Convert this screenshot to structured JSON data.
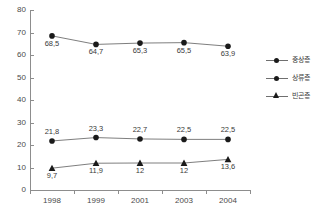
{
  "chart_data": {
    "type": "line",
    "title": "",
    "xlabel": "",
    "ylabel": "",
    "categories": [
      "1998",
      "1999",
      "2001",
      "2003",
      "2004"
    ],
    "ylim": [
      0,
      80
    ],
    "ytick_step": 10,
    "yticks": [
      "80",
      "70",
      "60",
      "50",
      "40",
      "30",
      "20",
      "10",
      "0"
    ],
    "grid": false,
    "legend_position": "right",
    "decimal_separator": ",",
    "series": [
      {
        "name": "중상층",
        "marker": "circle",
        "label_position": "below",
        "values": [
          68.5,
          64.7,
          65.3,
          65.5,
          63.9
        ],
        "labels": [
          "68,5",
          "64,7",
          "65,3",
          "65,5",
          "63,9"
        ]
      },
      {
        "name": "상류층",
        "marker": "circle",
        "label_position": "above",
        "values": [
          21.8,
          23.3,
          22.7,
          22.5,
          22.5
        ],
        "labels": [
          "21,8",
          "23,3",
          "22,7",
          "22,5",
          "22,5"
        ]
      },
      {
        "name": "빈곤층",
        "marker": "triangle",
        "label_position": "below",
        "values": [
          9.7,
          11.9,
          12,
          12,
          13.6
        ],
        "labels": [
          "9,7",
          "11,9",
          "12",
          "12",
          "13,6"
        ]
      }
    ],
    "colors": {
      "line": "#6f6f6f",
      "marker": "#1a1a1a",
      "axis": "#8d8d8d",
      "text": "#3a3a3a",
      "background": "#ffffff"
    }
  }
}
